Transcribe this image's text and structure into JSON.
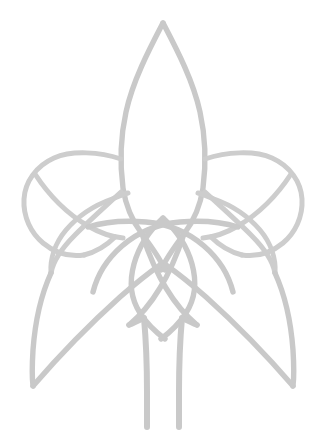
{
  "artwork": {
    "title": "Celtic Knotwork Emblem",
    "description": "Symmetric Celtic knotwork emblem resembling a winged figure or rocket, drawn in a single light-gray continuous line weight on a white background.",
    "style": "line-art",
    "symmetry": "bilateral-vertical",
    "background_color": "#ffffff",
    "stroke_color": "#c9c9c9",
    "stroke_width_px": 5.4,
    "canvas": {
      "width_px": 326,
      "height_px": 446
    },
    "elements": {
      "central_body": "central-pointed-leaf",
      "left_wing_knot": "left-triquetra",
      "right_wing_knot": "right-triquetra",
      "left_sweep": "left-wing-sweep",
      "right_sweep": "right-wing-sweep",
      "center_knot": "central-vesica-interlace",
      "tails": "twin-vertical-tails"
    },
    "key_points": {
      "apex_x": 163,
      "apex_y": 22,
      "left_extent_x": 22,
      "right_extent_x": 304,
      "bottom_extent_y": 428,
      "left_wing_tip_x": 33,
      "left_wing_tip_y": 385,
      "right_wing_tip_x": 293,
      "right_wing_tip_y": 385
    }
  }
}
